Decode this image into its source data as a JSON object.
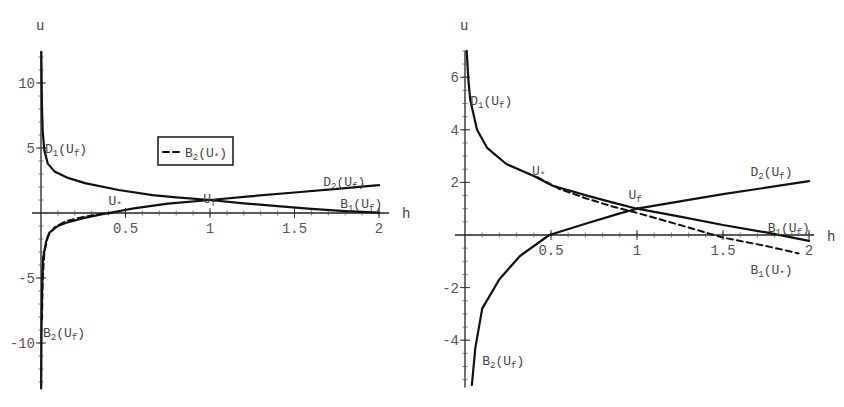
{
  "chart_data": [
    {
      "type": "line",
      "title": "",
      "xlabel": "h",
      "ylabel": "u",
      "xlim": [
        0,
        2
      ],
      "ylim": [
        -13.5,
        12.4
      ],
      "x_axis_extent": [
        -0.053,
        2.06
      ],
      "y_axis_extent": [
        -13.5,
        12.4
      ],
      "grid": false,
      "xticks": [
        0.5,
        1,
        1.5,
        2
      ],
      "xtick_labels": [
        "0.5",
        "1",
        "1.5",
        "2"
      ],
      "yticks": [
        -10,
        -5,
        5,
        10
      ],
      "ytick_labels": [
        "-10",
        "-5",
        "5",
        "10"
      ],
      "minor_xtick_step": 0.1,
      "minor_ytick_step": 1,
      "legend": {
        "position": "upper-center",
        "entries": [
          {
            "label": "B2(U*)",
            "base": "B",
            "sub": "2",
            "arg": "U",
            "argsub": "*",
            "style": "dashed"
          }
        ]
      },
      "series": [
        {
          "name": "D1(Uf)",
          "style": "solid",
          "points": [
            [
              0.002,
              12.4
            ],
            [
              0.004,
              9.6
            ],
            [
              0.006,
              8.0
            ],
            [
              0.01,
              6.3
            ],
            [
              0.02,
              4.8
            ],
            [
              0.04,
              3.8
            ],
            [
              0.08,
              3.2
            ],
            [
              0.16,
              2.7
            ],
            [
              0.26,
              2.3
            ],
            [
              0.46,
              1.77
            ],
            [
              0.66,
              1.38
            ],
            [
              0.8,
              1.2
            ],
            [
              1.0,
              1.0
            ]
          ]
        },
        {
          "name": "B1(Uf)",
          "style": "solid",
          "points": [
            [
              1.0,
              1.0
            ],
            [
              1.2,
              0.75
            ],
            [
              1.4,
              0.52
            ],
            [
              1.6,
              0.32
            ],
            [
              1.8,
              0.15
            ],
            [
              2.0,
              0.02
            ]
          ]
        },
        {
          "name": "B2(Uf)",
          "style": "solid",
          "points": [
            [
              0.001,
              -13.5
            ],
            [
              0.003,
              -9.0
            ],
            [
              0.006,
              -6.0
            ],
            [
              0.012,
              -3.5
            ],
            [
              0.03,
              -2.2
            ],
            [
              0.05,
              -1.5
            ],
            [
              0.1,
              -1.0
            ],
            [
              0.15,
              -0.75
            ],
            [
              0.25,
              -0.4
            ],
            [
              0.4,
              0.0
            ],
            [
              0.55,
              0.35
            ],
            [
              0.75,
              0.72
            ],
            [
              1.0,
              1.0
            ]
          ]
        },
        {
          "name": "D2(Uf)",
          "style": "solid",
          "points": [
            [
              1.0,
              1.0
            ],
            [
              1.25,
              1.3
            ],
            [
              1.5,
              1.58
            ],
            [
              1.75,
              1.86
            ],
            [
              2.0,
              2.15
            ]
          ]
        },
        {
          "name": "B2(U*)",
          "style": "dashed",
          "points": [
            [
              0.006,
              -8.2
            ],
            [
              0.01,
              -5.0
            ],
            [
              0.02,
              -3.0
            ],
            [
              0.04,
              -1.8
            ],
            [
              0.08,
              -1.1
            ],
            [
              0.15,
              -0.62
            ],
            [
              0.25,
              -0.3
            ],
            [
              0.35,
              -0.08
            ],
            [
              0.42,
              0.0
            ]
          ]
        }
      ],
      "annotations": [
        {
          "text": "D1(Uf)",
          "base": "D",
          "sub": "1",
          "arg": "U",
          "argsub": "f",
          "x": 0.024,
          "y": 4.6
        },
        {
          "text": "U*",
          "base": "U",
          "sub": "*",
          "x": 0.4,
          "y": 0.6
        },
        {
          "text": "Uf",
          "base": "U",
          "sub": "f",
          "x": 0.96,
          "y": 0.77
        },
        {
          "text": "D2(Uf)",
          "base": "D",
          "sub": "2",
          "arg": "U",
          "argsub": "f",
          "x": 1.67,
          "y": 2.1
        },
        {
          "text": "B1(Uf)",
          "base": "B",
          "sub": "1",
          "arg": "U",
          "argsub": "f",
          "x": 1.77,
          "y": 0.38
        },
        {
          "text": "B2(Uf)",
          "base": "B",
          "sub": "2",
          "arg": "U",
          "argsub": "f",
          "x": 0.012,
          "y": -9.5
        }
      ]
    },
    {
      "type": "line",
      "title": "",
      "xlabel": "h",
      "ylabel": "u",
      "xlim": [
        0,
        2
      ],
      "ylim": [
        -5.8,
        7.0
      ],
      "x_axis_extent": [
        -0.058,
        2.03
      ],
      "y_axis_extent": [
        -5.8,
        7.0
      ],
      "grid": false,
      "xticks": [
        0.5,
        1,
        1.5,
        2
      ],
      "xtick_labels": [
        "0.5",
        "1",
        "1.5",
        "2"
      ],
      "yticks": [
        -4,
        -2,
        2,
        4,
        6
      ],
      "ytick_labels": [
        "-4",
        "-2",
        "2",
        "4",
        "6"
      ],
      "minor_xtick_step": 0.1,
      "minor_ytick_step": 0.5,
      "series": [
        {
          "name": "D1(Uf)",
          "style": "solid",
          "points": [
            [
              0.01,
              7.0
            ],
            [
              0.02,
              5.9
            ],
            [
              0.03,
              5.15
            ],
            [
              0.07,
              4.0
            ],
            [
              0.13,
              3.3
            ],
            [
              0.24,
              2.7
            ],
            [
              0.4,
              2.24
            ],
            [
              0.51,
              1.87
            ],
            [
              0.71,
              1.5
            ],
            [
              0.85,
              1.25
            ],
            [
              1.0,
              1.0
            ]
          ]
        },
        {
          "name": "B1(Uf)",
          "style": "solid",
          "points": [
            [
              1.0,
              1.0
            ],
            [
              1.25,
              0.7
            ],
            [
              1.5,
              0.38
            ],
            [
              1.75,
              0.1
            ],
            [
              2.0,
              -0.22
            ]
          ]
        },
        {
          "name": "B1(U*)",
          "style": "dashed",
          "points": [
            [
              0.42,
              2.2
            ],
            [
              0.55,
              1.75
            ],
            [
              0.7,
              1.4
            ],
            [
              0.85,
              1.1
            ],
            [
              1.0,
              0.84
            ],
            [
              1.25,
              0.38
            ],
            [
              1.5,
              -0.1
            ],
            [
              1.75,
              -0.42
            ],
            [
              1.94,
              -0.7
            ]
          ]
        },
        {
          "name": "B2(Uf)",
          "style": "solid",
          "points": [
            [
              0.04,
              -5.7
            ],
            [
              0.06,
              -4.3
            ],
            [
              0.1,
              -2.8
            ],
            [
              0.2,
              -1.68
            ],
            [
              0.32,
              -0.8
            ],
            [
              0.49,
              0.0
            ],
            [
              0.71,
              0.45
            ],
            [
              0.9,
              0.82
            ],
            [
              1.0,
              1.0
            ]
          ]
        },
        {
          "name": "D2(Uf)",
          "style": "solid",
          "points": [
            [
              1.0,
              1.0
            ],
            [
              1.25,
              1.28
            ],
            [
              1.5,
              1.55
            ],
            [
              1.75,
              1.8
            ],
            [
              2.0,
              2.05
            ]
          ]
        }
      ],
      "annotations": [
        {
          "text": "D1(Uf)",
          "base": "D",
          "sub": "1",
          "arg": "U",
          "argsub": "f",
          "x": 0.03,
          "y": 4.94
        },
        {
          "text": "U*",
          "base": "U",
          "sub": "*",
          "x": 0.39,
          "y": 2.28
        },
        {
          "text": "Uf",
          "base": "U",
          "sub": "f",
          "x": 0.95,
          "y": 1.37
        },
        {
          "text": "D2(Uf)",
          "base": "D",
          "sub": "2",
          "arg": "U",
          "argsub": "f",
          "x": 1.66,
          "y": 2.24
        },
        {
          "text": "B1(Uf)",
          "base": "B",
          "sub": "1",
          "arg": "U",
          "argsub": "f",
          "x": 1.76,
          "y": 0.11
        },
        {
          "text": "B1(U*)",
          "base": "B",
          "sub": "1",
          "arg": "U",
          "argsub": "*",
          "x": 1.66,
          "y": -1.48
        },
        {
          "text": "B2(Uf)",
          "base": "B",
          "sub": "2",
          "arg": "U",
          "argsub": "f",
          "x": 0.1,
          "y": -4.94
        }
      ]
    }
  ]
}
